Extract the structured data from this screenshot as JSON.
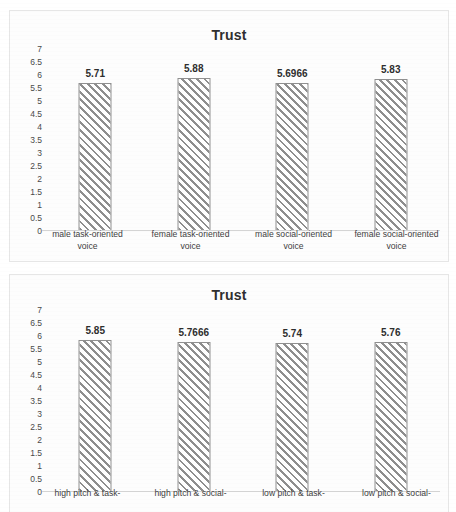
{
  "chart_data": [
    {
      "type": "bar",
      "title": "Trust",
      "xlabel": "",
      "ylabel": "",
      "ylim": [
        0,
        7
      ],
      "ytick_step": 0.5,
      "yticks": [
        "7",
        "6.5",
        "6",
        "5.5",
        "5",
        "4.5",
        "4",
        "3.5",
        "3",
        "2.5",
        "2",
        "1.5",
        "1",
        "0.5",
        "0"
      ],
      "grid": false,
      "legend": "none",
      "categories": [
        "male task-oriented voice",
        "female task-oriented voice",
        "male social-oriented voice",
        "female social-oriented voice"
      ],
      "category_lines": [
        [
          "male task-oriented",
          "voice"
        ],
        [
          "female task-oriented",
          "voice"
        ],
        [
          "male social-oriented",
          "voice"
        ],
        [
          "female social-oriented",
          "voice"
        ]
      ],
      "values": [
        5.71,
        5.88,
        5.6966,
        5.83
      ],
      "data_labels": [
        "5.71",
        "5.88",
        "5.6966",
        "5.83"
      ],
      "bar_fill": "white",
      "bar_pattern": "diagonal-hatch",
      "bar_edge_color": "#909090"
    },
    {
      "type": "bar",
      "title": "Trust",
      "xlabel": "",
      "ylabel": "",
      "ylim": [
        0,
        7
      ],
      "ytick_step": 0.5,
      "yticks": [
        "7",
        "6.5",
        "6",
        "5.5",
        "5",
        "4.5",
        "4",
        "3.5",
        "3",
        "2.5",
        "2",
        "1.5",
        "1",
        "0.5",
        "0"
      ],
      "grid": false,
      "legend": "none",
      "categories": [
        "high pitch & task-",
        "high pitch & social-",
        "low pitch & task-",
        "low pitch & social-"
      ],
      "category_lines": [
        [
          "high pitch & task-",
          ""
        ],
        [
          "high pitch & social-",
          ""
        ],
        [
          "low pitch & task-",
          ""
        ],
        [
          "low pitch & social-",
          ""
        ]
      ],
      "values": [
        5.85,
        5.7666,
        5.74,
        5.76
      ],
      "data_labels": [
        "5.85",
        "5.7666",
        "5.74",
        "5.76"
      ],
      "bar_fill": "white",
      "bar_pattern": "diagonal-hatch",
      "bar_edge_color": "#909090"
    }
  ]
}
